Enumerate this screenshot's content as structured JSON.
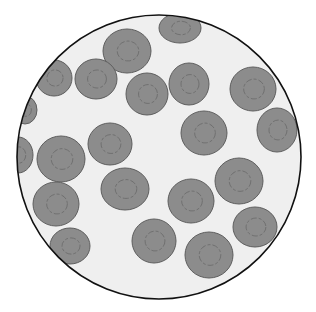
{
  "view": {
    "subject": "blood smear microscope field",
    "colors": {
      "background": "#ffffff",
      "field": "#efefef",
      "border": "#111111",
      "cell_fill": "#8c8c8c",
      "cell_stroke": "#5e5e5e",
      "cell_pallor": "#6a6a6a"
    },
    "field_circle": {
      "cx": 159,
      "cy": 157,
      "r": 142
    },
    "cells": [
      {
        "cx": 180,
        "cy": 28,
        "rx": 21,
        "ry": 15
      },
      {
        "cx": 127,
        "cy": 51,
        "rx": 24,
        "ry": 22
      },
      {
        "cx": 54,
        "cy": 78,
        "rx": 18,
        "ry": 18
      },
      {
        "cx": 96,
        "cy": 79,
        "rx": 21,
        "ry": 20
      },
      {
        "cx": 147,
        "cy": 94,
        "rx": 21,
        "ry": 21
      },
      {
        "cx": 189,
        "cy": 84,
        "rx": 20,
        "ry": 21
      },
      {
        "cx": 253,
        "cy": 89,
        "rx": 23,
        "ry": 22
      },
      {
        "cx": 25,
        "cy": 110,
        "rx": 12,
        "ry": 14
      },
      {
        "cx": 204,
        "cy": 133,
        "rx": 23,
        "ry": 22
      },
      {
        "cx": 277,
        "cy": 130,
        "rx": 20,
        "ry": 22
      },
      {
        "cx": 110,
        "cy": 144,
        "rx": 22,
        "ry": 21
      },
      {
        "cx": 18,
        "cy": 155,
        "rx": 15,
        "ry": 18
      },
      {
        "cx": 61,
        "cy": 159,
        "rx": 24,
        "ry": 23
      },
      {
        "cx": 125,
        "cy": 189,
        "rx": 24,
        "ry": 21
      },
      {
        "cx": 239,
        "cy": 181,
        "rx": 24,
        "ry": 23
      },
      {
        "cx": 191,
        "cy": 201,
        "rx": 23,
        "ry": 22
      },
      {
        "cx": 56,
        "cy": 204,
        "rx": 23,
        "ry": 22
      },
      {
        "cx": 255,
        "cy": 227,
        "rx": 22,
        "ry": 20
      },
      {
        "cx": 70,
        "cy": 246,
        "rx": 20,
        "ry": 18
      },
      {
        "cx": 154,
        "cy": 241,
        "rx": 22,
        "ry": 22
      },
      {
        "cx": 209,
        "cy": 255,
        "rx": 24,
        "ry": 23
      }
    ]
  }
}
